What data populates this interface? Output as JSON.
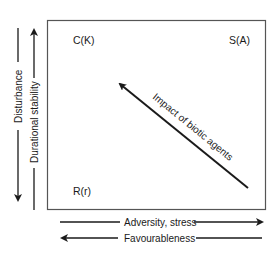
{
  "diagram": {
    "type": "strategy-triangle-frame",
    "corners": {
      "top_left": "C(K)",
      "top_right": "S(A)",
      "bottom_left": "R(r)"
    },
    "diagonal_arrow": {
      "label": "Impact of biotic agents",
      "direction": "from bottom-right toward top-left"
    },
    "left_axes": [
      {
        "label": "Disturbance",
        "direction": "down"
      },
      {
        "label": "Durational stability",
        "direction": "up"
      }
    ],
    "bottom_axes": [
      {
        "label": "Adversity, stress",
        "direction": "right"
      },
      {
        "label": "Favourableness",
        "direction": "left"
      }
    ],
    "colors": {
      "ink": "#1a1a1a",
      "frame": "#555555",
      "background": "#ffffff"
    }
  }
}
